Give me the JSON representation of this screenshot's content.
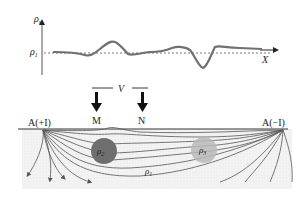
{
  "profile": {
    "y_axis_label": "ρ",
    "y_axis_sub": "s",
    "baseline_label": "ρ",
    "baseline_sub": "1",
    "x_axis_label": "X"
  },
  "measurement": {
    "voltage_label": "V",
    "electrode_m": "M",
    "electrode_n": "N"
  },
  "ground": {
    "source_left": "A(+I)",
    "source_right": "A(−I)",
    "body_conductive_label": "ρ",
    "body_conductive_sub": "2",
    "body_resistive_label": "ρ",
    "body_resistive_sub": "3",
    "host_label": "ρ",
    "host_sub": "1"
  },
  "colors": {
    "curve": "#707070",
    "conductive_body": "#6e6e6e",
    "resistive_body": "#b8b8b8",
    "ground_fill": "#f1f1f1",
    "lines": "#555555"
  }
}
